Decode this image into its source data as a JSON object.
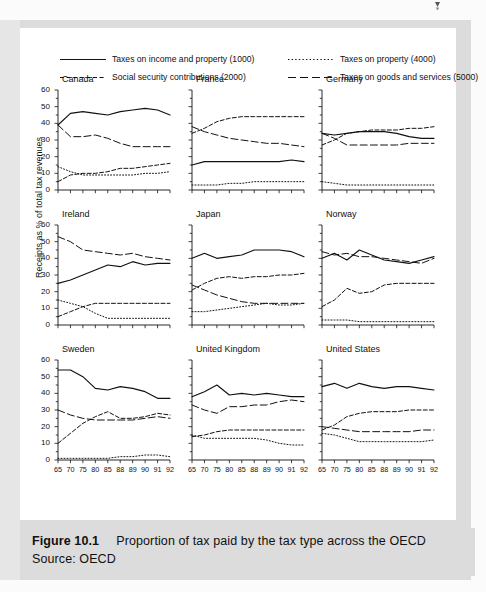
{
  "figure": {
    "caption_label": "Figure 10.1",
    "caption_text": "Proportion of tax paid by the tax type across the OECD",
    "source": "Source: OECD",
    "y_axis_label": "Receipts as % of total tax revenues"
  },
  "legend": {
    "items": [
      {
        "label": "Taxes on income and property (1000)",
        "style": "solid",
        "key": "income"
      },
      {
        "label": "Taxes on property (4000)",
        "style": "dotted",
        "key": "property"
      },
      {
        "label": "Social security contributions (2000)",
        "style": "dashed-short",
        "key": "social"
      },
      {
        "label": "Taxes on goods and services (5000)",
        "style": "dashed-long",
        "key": "goods"
      }
    ]
  },
  "axes": {
    "y_ticks": [
      0,
      10,
      20,
      30,
      40,
      50,
      60
    ],
    "y_minor_step": 5,
    "ylim": [
      0,
      60
    ],
    "x_ticks": [
      "65",
      "70",
      "75",
      "80",
      "85",
      "88",
      "89",
      "90",
      "91",
      "92"
    ],
    "x_label_rows": [
      2
    ]
  },
  "chart_data": {
    "type": "line",
    "title": "Proportion of tax paid by the tax type across the OECD",
    "subtitle": "Source: OECD",
    "xlabel": "",
    "ylabel": "Receipts as % of total tax revenues",
    "ylim": [
      0,
      60
    ],
    "grid": false,
    "legend_position": "top",
    "x": [
      "65",
      "70",
      "75",
      "80",
      "85",
      "88",
      "89",
      "90",
      "91",
      "92"
    ],
    "panels": [
      {
        "name": "Canada",
        "series": [
          {
            "name": "Taxes on income and property (1000)",
            "key": "income",
            "style": "solid",
            "values": [
              39,
              46,
              47,
              46,
              45,
              47,
              48,
              49,
              48,
              45
            ]
          },
          {
            "name": "Social security contributions (2000)",
            "key": "social",
            "style": "dashed-short",
            "values": [
              5,
              9,
              10,
              10,
              11,
              13,
              13,
              14,
              15,
              16
            ]
          },
          {
            "name": "Taxes on property (4000)",
            "key": "property",
            "style": "dotted",
            "values": [
              14,
              11,
              9,
              9,
              9,
              9,
              9,
              10,
              10,
              11
            ]
          },
          {
            "name": "Taxes on goods and services (5000)",
            "key": "goods",
            "style": "dashed-long",
            "values": [
              39,
              32,
              32,
              33,
              31,
              28,
              26,
              26,
              26,
              26
            ]
          }
        ]
      },
      {
        "name": "France",
        "series": [
          {
            "name": "Taxes on income and property (1000)",
            "key": "income",
            "style": "solid",
            "values": [
              15,
              17,
              17,
              17,
              17,
              17,
              17,
              17,
              18,
              17
            ]
          },
          {
            "name": "Social security contributions (2000)",
            "key": "social",
            "style": "dashed-short",
            "values": [
              34,
              37,
              41,
              43,
              44,
              44,
              44,
              44,
              44,
              44
            ]
          },
          {
            "name": "Taxes on property (4000)",
            "key": "property",
            "style": "dotted",
            "values": [
              3,
              3,
              3,
              4,
              4,
              5,
              5,
              5,
              5,
              5
            ]
          },
          {
            "name": "Taxes on goods and services (5000)",
            "key": "goods",
            "style": "dashed-long",
            "values": [
              38,
              35,
              33,
              31,
              30,
              29,
              28,
              28,
              27,
              26
            ]
          }
        ]
      },
      {
        "name": "Germany",
        "series": [
          {
            "name": "Taxes on income and property (1000)",
            "key": "income",
            "style": "solid",
            "values": [
              34,
              33,
              34,
              35,
              35,
              35,
              34,
              32,
              31,
              31
            ]
          },
          {
            "name": "Social security contributions (2000)",
            "key": "social",
            "style": "dashed-short",
            "values": [
              27,
              30,
              34,
              35,
              36,
              36,
              36,
              37,
              37,
              38
            ]
          },
          {
            "name": "Taxes on property (4000)",
            "key": "property",
            "style": "dotted",
            "values": [
              5,
              4,
              3,
              3,
              3,
              3,
              3,
              3,
              3,
              3
            ]
          },
          {
            "name": "Taxes on goods and services (5000)",
            "key": "goods",
            "style": "dashed-long",
            "values": [
              34,
              31,
              27,
              27,
              27,
              27,
              27,
              28,
              28,
              28
            ]
          }
        ]
      },
      {
        "name": "Ireland",
        "series": [
          {
            "name": "Taxes on income and property (1000)",
            "key": "income",
            "style": "solid",
            "values": [
              25,
              27,
              30,
              33,
              36,
              35,
              38,
              36,
              37,
              37
            ]
          },
          {
            "name": "Social security contributions (2000)",
            "key": "social",
            "style": "dashed-short",
            "values": [
              5,
              8,
              11,
              13,
              13,
              13,
              13,
              13,
              13,
              13
            ]
          },
          {
            "name": "Taxes on property (4000)",
            "key": "property",
            "style": "dotted",
            "values": [
              15,
              13,
              11,
              7,
              4,
              4,
              4,
              4,
              4,
              4
            ]
          },
          {
            "name": "Taxes on goods and services (5000)",
            "key": "goods",
            "style": "dashed-long",
            "values": [
              53,
              50,
              45,
              44,
              43,
              42,
              43,
              41,
              40,
              39
            ]
          }
        ]
      },
      {
        "name": "Japan",
        "series": [
          {
            "name": "Taxes on income and property (1000)",
            "key": "income",
            "style": "solid",
            "values": [
              40,
              43,
              40,
              41,
              42,
              45,
              45,
              45,
              44,
              41
            ]
          },
          {
            "name": "Social security contributions (2000)",
            "key": "social",
            "style": "dashed-short",
            "values": [
              21,
              25,
              28,
              29,
              28,
              29,
              29,
              30,
              30,
              31
            ]
          },
          {
            "name": "Taxes on property (4000)",
            "key": "property",
            "style": "dotted",
            "values": [
              8,
              8,
              9,
              10,
              11,
              12,
              13,
              12,
              12,
              13
            ]
          },
          {
            "name": "Taxes on goods and services (5000)",
            "key": "goods",
            "style": "dashed-long",
            "values": [
              24,
              21,
              18,
              16,
              14,
              13,
              13,
              13,
              13,
              13
            ]
          }
        ]
      },
      {
        "name": "Norway",
        "series": [
          {
            "name": "Taxes on income and property (1000)",
            "key": "income",
            "style": "solid",
            "values": [
              40,
              43,
              39,
              45,
              42,
              39,
              38,
              37,
              39,
              41
            ]
          },
          {
            "name": "Social security contributions (2000)",
            "key": "social",
            "style": "dashed-short",
            "values": [
              11,
              15,
              22,
              19,
              20,
              24,
              25,
              25,
              25,
              25
            ]
          },
          {
            "name": "Taxes on property (4000)",
            "key": "property",
            "style": "dotted",
            "values": [
              3,
              3,
              3,
              2,
              2,
              2,
              2,
              2,
              2,
              2
            ]
          },
          {
            "name": "Taxes on goods and services (5000)",
            "key": "goods",
            "style": "dashed-long",
            "values": [
              44,
              42,
              43,
              41,
              41,
              40,
              39,
              38,
              37,
              40
            ]
          }
        ]
      },
      {
        "name": "Sweden",
        "series": [
          {
            "name": "Taxes on income and property (1000)",
            "key": "income",
            "style": "solid",
            "values": [
              54,
              54,
              50,
              43,
              42,
              44,
              43,
              41,
              37,
              37
            ]
          },
          {
            "name": "Social security contributions (2000)",
            "key": "social",
            "style": "dashed-short",
            "values": [
              10,
              16,
              22,
              26,
              29,
              25,
              25,
              26,
              28,
              27
            ]
          },
          {
            "name": "Taxes on property (4000)",
            "key": "property",
            "style": "dotted",
            "values": [
              1,
              1,
              1,
              1,
              1,
              2,
              2,
              3,
              3,
              2
            ]
          },
          {
            "name": "Taxes on goods and services (5000)",
            "key": "goods",
            "style": "dashed-long",
            "values": [
              30,
              27,
              25,
              24,
              24,
              24,
              24,
              25,
              26,
              25
            ]
          }
        ]
      },
      {
        "name": "United Kingdom",
        "series": [
          {
            "name": "Taxes on income and property (1000)",
            "key": "income",
            "style": "solid",
            "values": [
              38,
              41,
              45,
              39,
              40,
              39,
              40,
              39,
              38,
              38
            ]
          },
          {
            "name": "Social security contributions (2000)",
            "key": "social",
            "style": "dashed-short",
            "values": [
              14,
              15,
              17,
              18,
              18,
              18,
              18,
              18,
              18,
              18
            ]
          },
          {
            "name": "Taxes on property (4000)",
            "key": "property",
            "style": "dotted",
            "values": [
              15,
              13,
              13,
              13,
              13,
              13,
              12,
              10,
              9,
              9
            ]
          },
          {
            "name": "Taxes on goods and services (5000)",
            "key": "goods",
            "style": "dashed-long",
            "values": [
              33,
              30,
              28,
              32,
              32,
              33,
              33,
              35,
              36,
              35
            ]
          }
        ]
      },
      {
        "name": "United States",
        "series": [
          {
            "name": "Taxes on income and property (1000)",
            "key": "income",
            "style": "solid",
            "values": [
              44,
              46,
              43,
              46,
              44,
              43,
              44,
              44,
              43,
              42
            ]
          },
          {
            "name": "Social security contributions (2000)",
            "key": "social",
            "style": "dashed-short",
            "values": [
              18,
              21,
              26,
              28,
              29,
              29,
              29,
              30,
              30,
              30
            ]
          },
          {
            "name": "Taxes on property (4000)",
            "key": "property",
            "style": "dotted",
            "values": [
              16,
              15,
              13,
              11,
              11,
              11,
              11,
              11,
              11,
              12
            ]
          },
          {
            "name": "Taxes on goods and services (5000)",
            "key": "goods",
            "style": "dashed-long",
            "values": [
              20,
              19,
              18,
              17,
              17,
              17,
              17,
              17,
              18,
              18
            ]
          }
        ]
      }
    ]
  }
}
